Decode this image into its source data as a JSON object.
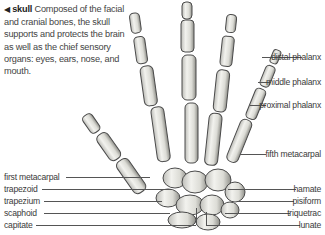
{
  "caption": {
    "arrow": "◀",
    "title": "skull",
    "text": " Composed of the facial and cranial bones, the skull supports and protects the brain as well as the chief sensory organs: eyes, ears, nose, and mouth."
  },
  "labels_right": [
    {
      "text": "distal phalanx"
    },
    {
      "text": "middle phalanx"
    },
    {
      "text": "proximal phalanx"
    },
    {
      "text": "fifth metacarpal"
    },
    {
      "text": "hamate"
    },
    {
      "text": "pisiform"
    },
    {
      "text": "triquetrac"
    },
    {
      "text": "lunate"
    }
  ],
  "labels_left": [
    {
      "text": "first metacarpal"
    },
    {
      "text": "trapezoid"
    },
    {
      "text": "trapezium"
    },
    {
      "text": "scaphoid"
    },
    {
      "text": "capitate"
    }
  ],
  "colors": {
    "bone_fill": "#e8e8e4",
    "bone_stroke": "#555555",
    "line": "#555555",
    "text": "#3a3a3a"
  }
}
